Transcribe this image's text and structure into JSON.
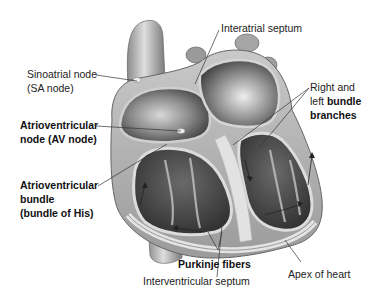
{
  "diagram": {
    "labels": {
      "interatrial_septum": "Interatrial septum",
      "sa_node_line1": "Sinoatrial node",
      "sa_node_line2": "(SA node)",
      "av_node_line1": "Atrioventricular",
      "av_node_line2": "node (AV node)",
      "his_line1": "Atrioventricular",
      "his_line2": "bundle",
      "his_line3": "(bundle of His)",
      "branches_line1": "Right and",
      "branches_line2_plain": "left ",
      "branches_line2_bold": "bundle",
      "branches_line3": "branches",
      "purkinje": "Purkinje fibers",
      "interventricular_septum": "Interventricular septum",
      "apex": "Apex of heart"
    },
    "colors": {
      "background": "#ffffff",
      "tissue_light": "#d9d9d9",
      "tissue_mid": "#a6a6a6",
      "tissue_dark": "#5a5a5a",
      "chamber_dark": "#4a4a4a",
      "leader_line": "#333333"
    }
  }
}
